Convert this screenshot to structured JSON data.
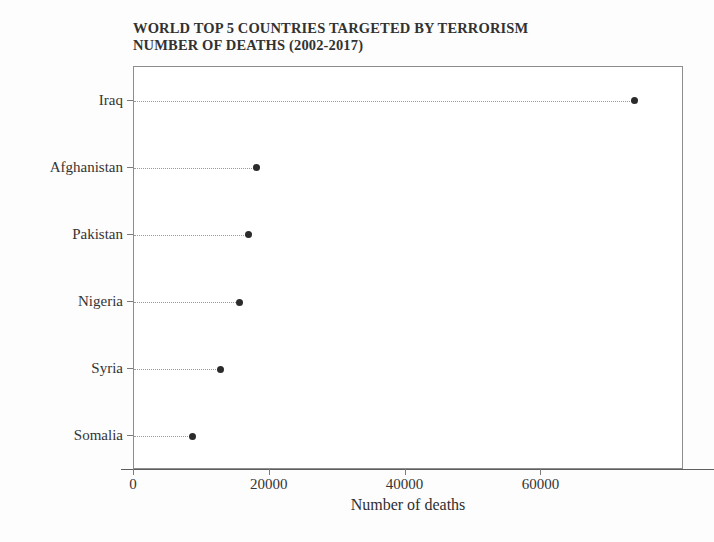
{
  "chart_data": {
    "type": "scatter",
    "title": "WORLD TOP 5 COUNTRIES TARGETED BY TERRORISM NUMBER OF DEATHS (2002-2017)",
    "title_lines": [
      "WORLD TOP 5 COUNTRIES TARGETED BY TERRORISM",
      "NUMBER OF DEATHS (2002-2017)"
    ],
    "subtitle": "",
    "orientation": "horizontal",
    "categories": [
      "Iraq",
      "Afghanistan",
      "Pakistan",
      "Nigeria",
      "Syria",
      "Somalia"
    ],
    "values": [
      73700,
      18000,
      16800,
      15600,
      12700,
      8550
    ],
    "series": [
      {
        "name": "Number of deaths",
        "values": [
          73700,
          18000,
          16800,
          15600,
          12700,
          8550
        ]
      }
    ],
    "xlabel": "Number of deaths",
    "ylabel": "",
    "xlim": [
      0,
      81000
    ],
    "ylim": [
      0,
      6
    ],
    "xticks": [
      0,
      20000,
      40000,
      60000
    ],
    "xtick_labels": [
      "0",
      "20000",
      "40000",
      "60000"
    ],
    "ytick_labels": [
      "Iraq",
      "Afghanistan",
      "Pakistan",
      "Nigeria",
      "Syria",
      "Somalia"
    ],
    "grid": false,
    "legend": false,
    "legend_position": "none",
    "marker": "circle-filled",
    "leader_line_style": "dotted",
    "colors": {
      "marker": "#2b2b2b",
      "leader": "#9a9a9a",
      "axis": "#7b7b7b",
      "frame": "#8d8d8d",
      "text": "#343434",
      "background": "#ffffff"
    }
  }
}
